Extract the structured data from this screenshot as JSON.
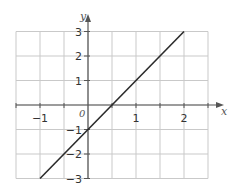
{
  "chart_data": {
    "type": "line",
    "title": "",
    "xlabel": "x",
    "ylabel": "y",
    "origin_label": "0",
    "xlim": [
      -1.5,
      2.5
    ],
    "ylim": [
      -3,
      3
    ],
    "grid": true,
    "grid_step_x": 0.5,
    "grid_step_y": 1,
    "x_ticks": [
      -1,
      1,
      2
    ],
    "x_tick_labels": [
      "−1",
      "1",
      "2"
    ],
    "y_ticks": [
      3,
      2,
      1,
      -1,
      -2,
      -3
    ],
    "y_tick_labels": [
      "3",
      "2",
      "1",
      "−1",
      "−2",
      "−3"
    ],
    "series": [
      {
        "name": "y = 2x − 1",
        "x": [
          -1,
          2
        ],
        "y": [
          -3,
          3
        ],
        "color": "#2b2b2b"
      }
    ],
    "legend": null
  },
  "colors": {
    "grid": "#c9c9c9",
    "axis": "#555555",
    "line": "#2b2b2b",
    "text": "#333333"
  }
}
